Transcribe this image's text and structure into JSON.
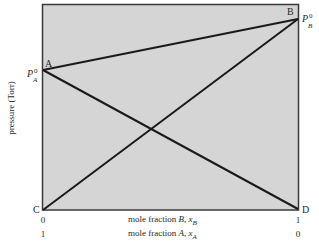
{
  "diagram": {
    "type": "vapor-pressure-composition",
    "colors": {
      "plot_fill": "#d5d5d5",
      "frame": "#3a3a3a",
      "line": "#1a1a1a",
      "text": "#2a2a2a"
    },
    "points": {
      "A": {
        "label": "A",
        "pressure_label": "P",
        "pressure_sup": "0",
        "pressure_sub": "A"
      },
      "B": {
        "label": "B",
        "pressure_label": "P",
        "pressure_sup": "0",
        "pressure_sub": "B"
      },
      "C": {
        "label": "C"
      },
      "D": {
        "label": "D"
      }
    },
    "lines": [
      {
        "from": "A",
        "to": "B",
        "meaning": "total pressure"
      },
      {
        "from": "C",
        "to": "B",
        "meaning": "partial pressure of B"
      },
      {
        "from": "A",
        "to": "D",
        "meaning": "partial pressure of A"
      }
    ],
    "y_axis": {
      "label": "pressure (Torr)"
    },
    "x_axis": {
      "row1": {
        "left": "0",
        "right": "1",
        "label_prefix": "mole fraction ",
        "label_var": "B",
        "label_sep": ", ",
        "label_x": "x",
        "label_sub": "B"
      },
      "row2": {
        "left": "1",
        "right": "0",
        "label_prefix": "mole fraction ",
        "label_var": "A",
        "label_sep": ", ",
        "label_x": "x",
        "label_sub": "A"
      }
    }
  }
}
